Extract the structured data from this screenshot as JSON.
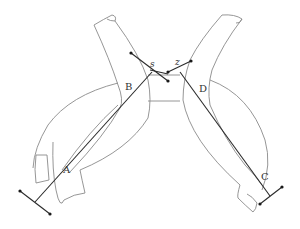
{
  "diagram": {
    "type": "anatomical line drawing",
    "labels": {
      "A": "A",
      "B": "B",
      "C": "C",
      "D": "D",
      "s": "s",
      "z": "z"
    },
    "colors": {
      "background": "#ffffff",
      "outline": "#8a8a8a",
      "rod": "#2a2a2a"
    }
  }
}
